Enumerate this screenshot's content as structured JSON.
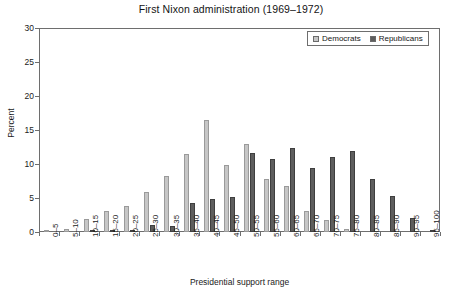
{
  "chart_data": {
    "type": "bar",
    "title": "First Nixon administration (1969–1972)",
    "xlabel": "Presidential support range",
    "ylabel": "Percent",
    "ylim": [
      0,
      30
    ],
    "ytick_step": 5,
    "yticks": [
      0,
      5,
      10,
      15,
      20,
      25,
      30
    ],
    "grid": false,
    "legend_position": "top-right",
    "categories": [
      "0–5",
      "5–10",
      "10–15",
      "15–20",
      "20–25",
      "25–30",
      "30–35",
      "35–40",
      "40–45",
      "45–50",
      "50–55",
      "55–60",
      "60–65",
      "65–70",
      "70–75",
      "75–80",
      "80–85",
      "85–90",
      "90–95",
      "95–100"
    ],
    "series": [
      {
        "name": "Democrats",
        "color": "#c6c6c6",
        "values": [
          0.2,
          0.5,
          1.9,
          3.1,
          3.8,
          5.9,
          8.2,
          11.5,
          16.5,
          9.9,
          13.0,
          7.8,
          6.8,
          3.1,
          1.8,
          0.4,
          0.0,
          0.0,
          0.0,
          0.0
        ]
      },
      {
        "name": "Republicans",
        "color": "#5e5e5e",
        "values": [
          0.0,
          0.0,
          0.15,
          0.3,
          0.3,
          1.1,
          0.9,
          4.2,
          4.9,
          5.1,
          11.6,
          10.8,
          12.3,
          9.4,
          11.0,
          11.9,
          7.8,
          5.3,
          2.1,
          0.2
        ]
      }
    ]
  },
  "legend": {
    "entries": [
      {
        "label": "Democrats",
        "swatch": "democrats-swatch"
      },
      {
        "label": "Republicans",
        "swatch": "republicans-swatch"
      }
    ]
  }
}
